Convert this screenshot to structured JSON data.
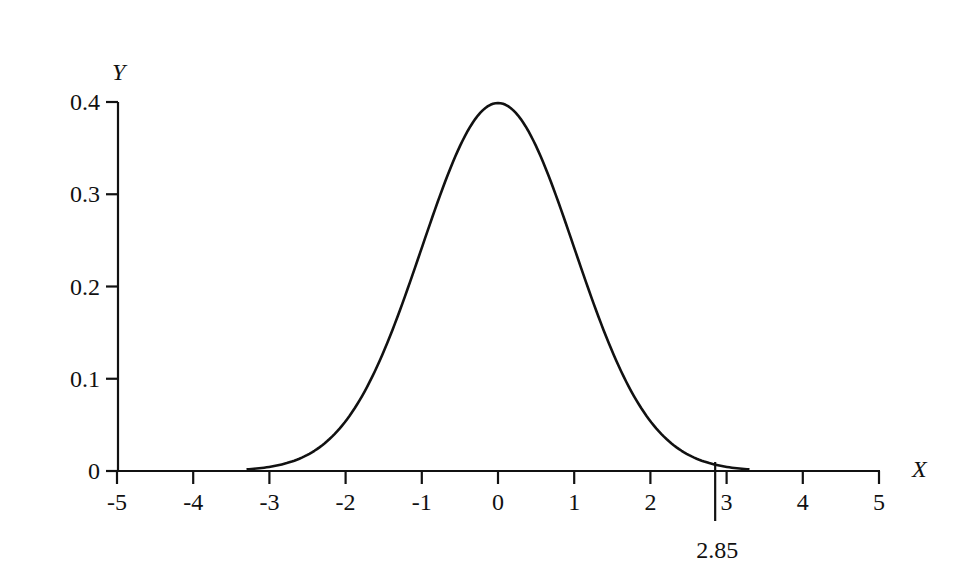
{
  "chart_data": {
    "type": "line",
    "title": "",
    "xlabel": "X",
    "ylabel": "Y",
    "xlim": [
      -5,
      5
    ],
    "ylim": [
      0,
      0.4
    ],
    "x_ticks": [
      -5,
      -4,
      -3,
      -2,
      -1,
      0,
      1,
      2,
      3,
      4,
      5
    ],
    "x_tick_labels": [
      "-5",
      "-4",
      "-3",
      "-2",
      "-1",
      "0",
      "1",
      "2",
      "3",
      "4",
      "5"
    ],
    "y_ticks": [
      0,
      0.1,
      0.2,
      0.3,
      0.4
    ],
    "y_tick_labels": [
      "0",
      "0.1",
      "0.2",
      "0.3",
      "0.4"
    ],
    "grid": false,
    "legend": null,
    "series": [
      {
        "name": "standard normal density",
        "x": [
          -3.3,
          -3.0,
          -2.5,
          -2.0,
          -1.5,
          -1.0,
          -0.5,
          0.0,
          0.5,
          1.0,
          1.5,
          2.0,
          2.5,
          3.0,
          3.3
        ],
        "y": [
          0.002,
          0.004,
          0.018,
          0.054,
          0.13,
          0.242,
          0.352,
          0.399,
          0.352,
          0.242,
          0.13,
          0.054,
          0.018,
          0.004,
          0.002
        ]
      }
    ],
    "annotations": [
      {
        "type": "vertical-marker",
        "x": 2.85,
        "label": "2.85"
      }
    ]
  }
}
